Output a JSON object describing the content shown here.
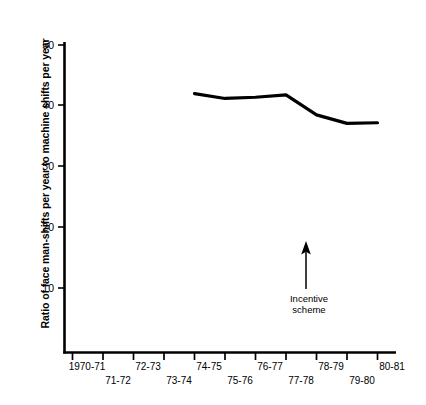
{
  "chart_data": {
    "type": "line",
    "title": "",
    "xlabel": "",
    "ylabel": "Ratio of face man-shifts per year to machine shifts per year",
    "categories": [
      "1970-71",
      "71-72",
      "72-73",
      "73-74",
      "74-75",
      "75-76",
      "76-77",
      "77-78",
      "78-79",
      "79-80",
      "80-81"
    ],
    "x_tick_labels_upper": [
      "1970-71",
      "72-73",
      "74-75",
      "76-77",
      "78-79",
      "80-81"
    ],
    "x_tick_labels_lower": [
      "71-72",
      "73-74",
      "75-76",
      "77-78",
      "79-80"
    ],
    "y_tick_labels": [
      "50",
      "40",
      "30",
      "20",
      "10"
    ],
    "y_ticks": [
      50,
      40,
      30,
      20,
      10
    ],
    "ylim": [
      0,
      50
    ],
    "grid": false,
    "legend": false,
    "series": [
      {
        "name": "Ratio of face man-shifts per year to machine shifts per year",
        "x": [
          "74-75",
          "75-76",
          "76-77",
          "77-78",
          "78-79",
          "79-80",
          "80-81"
        ],
        "values": [
          42.0,
          41.2,
          41.4,
          41.8,
          38.5,
          37.1,
          37.2
        ],
        "color": "#000000"
      }
    ],
    "annotations": [
      {
        "name": "incentive-scheme",
        "text_line1": "Incentive",
        "text_line2": "scheme",
        "arrow": "up-arrow",
        "at_category": "77-78"
      }
    ]
  },
  "axis": {
    "y_title": "Ratio of face man-shifts per year to machine shifts per year",
    "y_labels": {
      "t50": "50",
      "t40": "40",
      "t30": "30",
      "t20": "20",
      "t10": "10"
    },
    "x_labels_upper": {
      "l0": "1970-71",
      "l1": "72-73",
      "l2": "74-75",
      "l3": "76-77",
      "l4": "78-79",
      "l5": "80-81"
    },
    "x_labels_lower": {
      "l0": "71-72",
      "l1": "73-74",
      "l2": "75-76",
      "l3": "77-78",
      "l4": "79-80"
    }
  },
  "annotation": {
    "line1": "Incentive",
    "line2": "scheme"
  },
  "colors": {
    "background": "#ffffff",
    "ink": "#000000",
    "series": "#000000"
  }
}
